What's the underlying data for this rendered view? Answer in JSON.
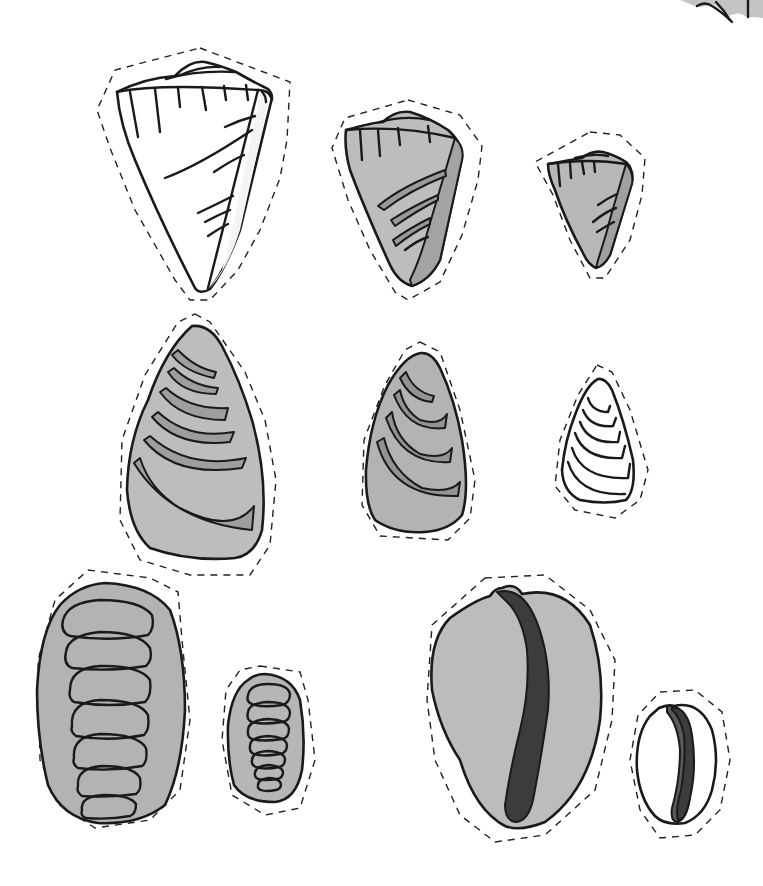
{
  "page": {
    "title": "",
    "background": "#ffffff"
  },
  "colors": {
    "shell_light": "#bdbdbd",
    "shell_mid": "#a9a9a9",
    "band_dark": "#8a8a8a",
    "aperture_dark": "#3c3c3c",
    "white": "#ffffff",
    "line": "#1a1a1a"
  },
  "shells": [
    {
      "id": "cone-large",
      "type": "cone-shell",
      "fill": "white",
      "row": 1,
      "col": 1
    },
    {
      "id": "cone-medium",
      "type": "cone-shell",
      "fill": "gray",
      "row": 1,
      "col": 2
    },
    {
      "id": "cone-small",
      "type": "cone-shell",
      "fill": "gray",
      "row": 1,
      "col": 3
    },
    {
      "id": "mussel-large",
      "type": "limpet-shell",
      "fill": "gray",
      "row": 2,
      "col": 1
    },
    {
      "id": "mussel-medium",
      "type": "limpet-shell",
      "fill": "gray",
      "row": 2,
      "col": 2
    },
    {
      "id": "mussel-small",
      "type": "limpet-shell",
      "fill": "white",
      "row": 2,
      "col": 3
    },
    {
      "id": "chiton-large",
      "type": "chiton-shell",
      "fill": "gray",
      "row": 3,
      "col": 1
    },
    {
      "id": "chiton-small",
      "type": "chiton-shell",
      "fill": "gray",
      "row": 3,
      "col": 2
    },
    {
      "id": "cowrie-large",
      "type": "cowrie-shell",
      "fill": "gray",
      "row": 3,
      "col": 3
    },
    {
      "id": "cowrie-small",
      "type": "cowrie-shell",
      "fill": "white",
      "row": 3,
      "col": 4
    }
  ],
  "partial_shell_top_right": {
    "type": "shell-fragment",
    "fill": "gray"
  }
}
